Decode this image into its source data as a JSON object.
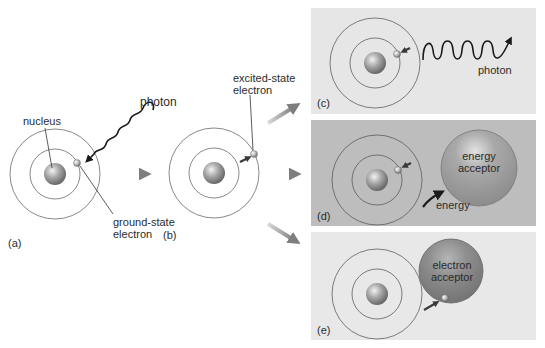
{
  "colors": {
    "background": "#ffffff",
    "panel_c_bg": "#e6e6e6",
    "panel_d_bg": "#bdbdbd",
    "panel_e_bg": "#e8e8e8",
    "orbit": "#7a7a7a",
    "nucleus": "#8f8f8f",
    "acceptor": "#9a9a9a",
    "arrow_gray": "#8a8a8a",
    "text": "#2b2b2b"
  },
  "panels": {
    "a": {
      "tag": "(a)",
      "nucleus_label": "nucleus",
      "photon_label": "photon",
      "electron_label_line1": "ground-state",
      "electron_label_line2": "electron"
    },
    "b": {
      "tag": "(b)",
      "electron_label_line1": "excited-state",
      "electron_label_line2": "electron"
    },
    "c": {
      "tag": "(c)",
      "photon_label": "photon"
    },
    "d": {
      "tag": "(d)",
      "acceptor_line1": "energy",
      "acceptor_line2": "acceptor",
      "energy_label": "energy"
    },
    "e": {
      "tag": "(e)",
      "acceptor_line1": "electron",
      "acceptor_line2": "acceptor"
    }
  }
}
